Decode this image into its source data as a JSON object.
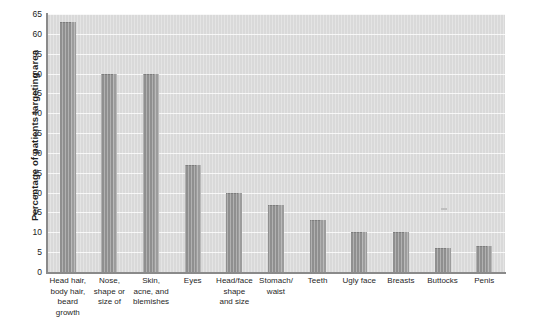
{
  "figure": {
    "ylabel": "Percentage of patients targeting area",
    "copyright": "Copyright © Cengage Learning 2013",
    "plot_bg_color": "#d9d9d9",
    "bar_color": "#8f8f8f",
    "gridline_color": "#f7f7f7",
    "axis_color": "#8a8a8a"
  },
  "chart_data": {
    "type": "bar",
    "title": "",
    "xlabel": "",
    "ylabel": "Percentage of patients targeting area",
    "ylim": [
      0,
      65
    ],
    "ytick_step": 5,
    "yticks": [
      0,
      5,
      10,
      15,
      20,
      25,
      30,
      35,
      40,
      45,
      50,
      55,
      60,
      65
    ],
    "grid": true,
    "legend": false,
    "categories": [
      "Head hair, body hair, beard growth",
      "Nose, shape or size of",
      "Skin, acne, and blemishes",
      "Eyes",
      "Head/face shape and size",
      "Stomach/ waist",
      "Teeth",
      "Ugly face",
      "Breasts",
      "Buttocks",
      "Penis"
    ],
    "category_lines": [
      [
        "Head hair,",
        "body hair,",
        "beard",
        "growth"
      ],
      [
        "Nose,",
        "shape or",
        "size of"
      ],
      [
        "Skin,",
        "acne, and",
        "blemishes"
      ],
      [
        "Eyes"
      ],
      [
        "Head/face",
        "shape",
        "and size"
      ],
      [
        "Stomach/",
        "waist"
      ],
      [
        "Teeth"
      ],
      [
        "Ugly face"
      ],
      [
        "Breasts"
      ],
      [
        "Buttocks"
      ],
      [
        "Penis"
      ]
    ],
    "values": [
      63,
      50,
      50,
      27,
      20,
      17,
      13,
      10,
      10,
      6,
      6.5
    ]
  }
}
